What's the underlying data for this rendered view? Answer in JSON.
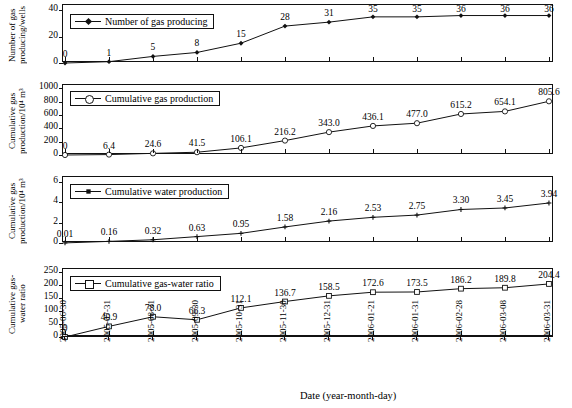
{
  "figure": {
    "xlabel": "Date (year-month-day)",
    "x_categories": [
      "2005-06-30",
      "2005-07-31",
      "2005-08-31",
      "2005-09-30",
      "2005-10-31",
      "2005-11-30",
      "2005-12-31",
      "2006-01-21",
      "2006-01-31",
      "2006-02-28",
      "2006-03-08",
      "2006-03-31"
    ]
  },
  "chart_data": [
    {
      "type": "line",
      "title": "",
      "legend": "Number of gas producing",
      "ylabel": "Number of gas producing/wells",
      "xlabel": "Date (year-month-day)",
      "marker": "diamond-filled",
      "categories": [
        "2005-06-30",
        "2005-07-31",
        "2005-08-31",
        "2005-09-30",
        "2005-10-31",
        "2005-11-30",
        "2005-12-31",
        "2006-01-21",
        "2006-01-31",
        "2006-02-28",
        "2006-03-08",
        "2006-03-31"
      ],
      "values": [
        0,
        1,
        5,
        8,
        15,
        28,
        31,
        35,
        35,
        36,
        36,
        36
      ],
      "point_labels": [
        "0",
        "1",
        "5",
        "8",
        "15",
        "28",
        "31",
        "35",
        "35",
        "36",
        "36",
        "36"
      ],
      "yticks": [
        0,
        20,
        40
      ],
      "ylim": [
        0,
        44
      ],
      "grid": false,
      "legend_position": "top-left"
    },
    {
      "type": "line",
      "title": "",
      "legend": "Cumulative gas production",
      "ylabel": "Cumulative gas production/10⁴ m³",
      "xlabel": "Date (year-month-day)",
      "marker": "circle-open",
      "categories": [
        "2005-06-30",
        "2005-07-31",
        "2005-08-31",
        "2005-09-30",
        "2005-10-31",
        "2005-11-30",
        "2005-12-31",
        "2006-01-21",
        "2006-01-31",
        "2006-02-28",
        "2006-03-08",
        "2006-03-31"
      ],
      "values": [
        0,
        6.4,
        24.6,
        41.5,
        106.1,
        216.2,
        343.0,
        436.1,
        477.0,
        615.2,
        654.1,
        805.6
      ],
      "point_labels": [
        "0",
        "6.4",
        "24.6",
        "41.5",
        "106.1",
        "216.2",
        "343.0",
        "436.1",
        "477.0",
        "615.2",
        "654.1",
        "805.6"
      ],
      "yticks": [
        0,
        200,
        400,
        600,
        800,
        1000
      ],
      "ylim": [
        0,
        1050
      ],
      "grid": false,
      "legend_position": "top-left"
    },
    {
      "type": "line",
      "title": "",
      "legend": "Cumulative water production",
      "ylabel": "Cumulative gas production/10⁴ m³",
      "xlabel": "Date (year-month-day)",
      "marker": "plus-filled",
      "categories": [
        "2005-06-30",
        "2005-07-31",
        "2005-08-31",
        "2005-09-30",
        "2005-10-31",
        "2005-11-30",
        "2005-12-31",
        "2006-01-21",
        "2006-01-31",
        "2006-02-28",
        "2006-03-08",
        "2006-03-31"
      ],
      "values": [
        0.01,
        0.16,
        0.32,
        0.63,
        0.95,
        1.58,
        2.16,
        2.53,
        2.75,
        3.3,
        3.45,
        3.94
      ],
      "point_labels": [
        "0.01",
        "0.16",
        "0.32",
        "0.63",
        "0.95",
        "1.58",
        "2.16",
        "2.53",
        "2.75",
        "3.30",
        "3.45",
        "3.94"
      ],
      "yticks": [
        0,
        2,
        4,
        6
      ],
      "ylim": [
        0,
        6.5
      ],
      "grid": false,
      "legend_position": "top-left"
    },
    {
      "type": "line",
      "title": "",
      "legend": "Cumulative gas-water ratio",
      "ylabel": "Cumulative gas-water ratio",
      "xlabel": "Date (year-month-day)",
      "marker": "square-open",
      "categories": [
        "2005-06-30",
        "2005-07-31",
        "2005-08-31",
        "2005-09-30",
        "2005-10-31",
        "2005-11-30",
        "2005-12-31",
        "2006-01-21",
        "2006-01-31",
        "2006-02-28",
        "2006-03-08",
        "2006-03-31"
      ],
      "values": [
        0,
        40.9,
        78.0,
        66.3,
        112.1,
        136.7,
        158.5,
        172.6,
        173.5,
        186.2,
        189.8,
        204.4
      ],
      "point_labels": [
        "0",
        "40.9",
        "78.0",
        "66.3",
        "112.1",
        "136.7",
        "158.5",
        "172.6",
        "173.5",
        "186.2",
        "189.8",
        "204.4"
      ],
      "yticks": [
        0,
        50,
        100,
        150,
        200,
        250
      ],
      "ylim": [
        0,
        262
      ],
      "grid": false,
      "legend_position": "top-left"
    }
  ]
}
